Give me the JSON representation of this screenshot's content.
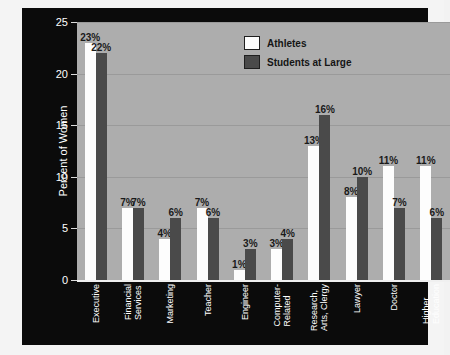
{
  "chart_data": {
    "type": "bar",
    "title": "",
    "xlabel": "",
    "ylabel": "Percent of Women",
    "ylim": [
      0,
      25
    ],
    "yticks": [
      0,
      5,
      10,
      15,
      20,
      25
    ],
    "grid": true,
    "legend_position": "top-center",
    "categories": [
      "Executive",
      "Financial Services",
      "Marketing",
      "Teacher",
      "Engineer",
      "Computer-Related",
      "Research, Arts, Clergy",
      "Lawyer",
      "Doctor",
      "Higher Education"
    ],
    "category_lines": [
      [
        "Executive"
      ],
      [
        "Financial",
        "Services"
      ],
      [
        "Marketing"
      ],
      [
        "Teacher"
      ],
      [
        "Engineer"
      ],
      [
        "Computer-",
        "Related"
      ],
      [
        "Research,",
        "Arts, Clergy"
      ],
      [
        "Lawyer"
      ],
      [
        "Doctor"
      ],
      [
        "Higher",
        "Education"
      ]
    ],
    "series": [
      {
        "name": "Athletes",
        "color": "#fdfdfd",
        "values": [
          23,
          7,
          4,
          7,
          1,
          3,
          13,
          8,
          11,
          11
        ],
        "labels": [
          "23%",
          "7%",
          "4%",
          "7%",
          "1%",
          "3%",
          "13%",
          "8%",
          "11%",
          "11%"
        ]
      },
      {
        "name": "Students at Large",
        "color": "#4a4a4a",
        "values": [
          22,
          7,
          6,
          6,
          3,
          4,
          16,
          10,
          7,
          6
        ],
        "labels": [
          "22%",
          "7%",
          "6%",
          "6%",
          "3%",
          "4%",
          "16%",
          "10%",
          "7%",
          "6%"
        ]
      }
    ]
  },
  "legend": {
    "items": [
      {
        "label": "Athletes"
      },
      {
        "label": "Students at Large"
      }
    ]
  },
  "axis": {
    "y_title": "Percent of Women",
    "y_tick_labels": [
      "0",
      "5",
      "10",
      "15",
      "20",
      "25"
    ]
  },
  "colors": {
    "panel_background": "#0b0b0b",
    "plot_background": "#adadad",
    "gridline": "#9a9a9a",
    "series_light": "#fdfdfd",
    "series_dark": "#4a4a4a",
    "axis_text": "#ffffff",
    "value_text": "#1a1a1a"
  }
}
